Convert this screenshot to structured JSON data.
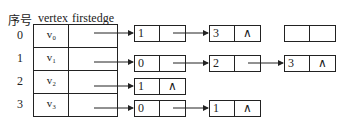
{
  "headers": {
    "index": "序号",
    "vertex": "vertex",
    "firstedge": "firstedge"
  },
  "rows": [
    {
      "index": "0",
      "vertex": "v₀",
      "list": [
        {
          "adj": "1",
          "next": ""
        },
        {
          "adj": "3",
          "next": "∧"
        }
      ]
    },
    {
      "index": "1",
      "vertex": "v₁",
      "list": [
        {
          "adj": "0",
          "next": ""
        },
        {
          "adj": "2",
          "next": ""
        },
        {
          "adj": "3",
          "next": "∧"
        }
      ]
    },
    {
      "index": "2",
      "vertex": "v₂",
      "list": [
        {
          "adj": "1",
          "next": "∧"
        }
      ]
    },
    {
      "index": "3",
      "vertex": "v₃",
      "list": [
        {
          "adj": "0",
          "next": ""
        },
        {
          "adj": "1",
          "next": "∧"
        }
      ]
    }
  ],
  "legend_node": {
    "adj": "",
    "next": ""
  }
}
